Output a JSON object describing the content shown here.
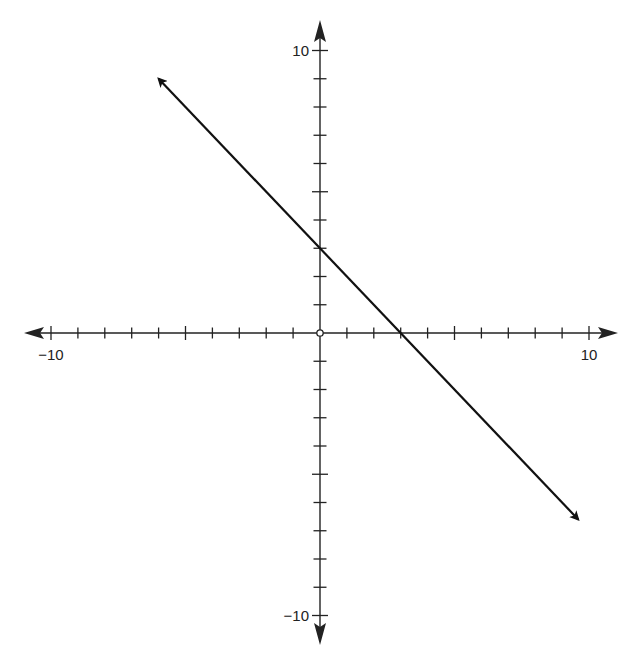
{
  "chart_data": {
    "type": "line",
    "title": "",
    "xlabel": "",
    "ylabel": "",
    "xlim": [
      -10,
      10
    ],
    "ylim": [
      -10,
      10
    ],
    "grid": false,
    "legend": null,
    "axis_tick_step": 1,
    "axis_labels_shown": {
      "x": [
        {
          "value": -10,
          "label": "−10"
        },
        {
          "value": 10,
          "label": "10"
        }
      ],
      "y": [
        {
          "value": 10,
          "label": "10"
        },
        {
          "value": -10,
          "label": "−10"
        }
      ]
    },
    "origin_marker": "open-circle",
    "series": [
      {
        "name": "line",
        "equation": "y = -x + 3",
        "slope": -1,
        "y_intercept": 3,
        "x_intercept": 3,
        "arrows_both_ends": true,
        "x": [
          -6,
          0,
          3,
          9.6
        ],
        "y": [
          9,
          3,
          0,
          -6.6
        ]
      }
    ]
  },
  "colors": {
    "axis": "#222222",
    "line": "#111111",
    "background": "#ffffff"
  }
}
